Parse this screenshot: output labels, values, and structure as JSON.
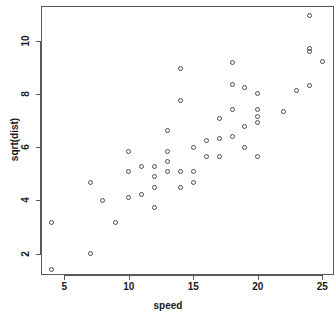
{
  "chart_data": {
    "type": "scatter",
    "title": "",
    "xlabel": "speed",
    "ylabel": "sqrt(dist)",
    "xlim": [
      3.2,
      25.9
    ],
    "ylim": [
      1.2,
      11.3
    ],
    "xticks": [
      5,
      10,
      15,
      20,
      25
    ],
    "yticks": [
      2,
      4,
      6,
      8,
      10
    ],
    "grid": false,
    "legend": null,
    "point_symbol": "open-circle",
    "point_color": "#4d4d4d",
    "n_points": 50,
    "x": [
      4,
      4,
      7,
      7,
      8,
      9,
      10,
      10,
      10,
      11,
      11,
      12,
      12,
      12,
      12,
      13,
      13,
      13,
      13,
      14,
      14,
      14,
      14,
      15,
      15,
      15,
      16,
      16,
      17,
      17,
      17,
      18,
      18,
      18,
      18,
      19,
      19,
      19,
      20,
      20,
      20,
      20,
      20,
      22,
      23,
      24,
      24,
      24,
      24,
      25
    ],
    "y": [
      1.41,
      3.16,
      2.0,
      4.69,
      4.0,
      3.16,
      4.12,
      5.1,
      5.83,
      4.24,
      5.29,
      3.74,
      4.47,
      4.9,
      5.29,
      5.1,
      5.48,
      5.83,
      6.63,
      4.47,
      5.1,
      7.75,
      8.94,
      4.69,
      5.1,
      6.0,
      5.66,
      6.24,
      5.66,
      6.32,
      7.07,
      6.4,
      7.42,
      8.37,
      9.17,
      6.0,
      6.78,
      8.25,
      5.66,
      6.93,
      7.14,
      7.42,
      8.0,
      7.35,
      8.12,
      8.31,
      9.59,
      9.7,
      10.95,
      9.22
    ],
    "points": [
      {
        "x": 4,
        "y": 1.41
      },
      {
        "x": 4,
        "y": 3.16
      },
      {
        "x": 7,
        "y": 2.0
      },
      {
        "x": 7,
        "y": 4.69
      },
      {
        "x": 8,
        "y": 4.0
      },
      {
        "x": 9,
        "y": 3.16
      },
      {
        "x": 10,
        "y": 4.12
      },
      {
        "x": 10,
        "y": 5.1
      },
      {
        "x": 10,
        "y": 5.83
      },
      {
        "x": 11,
        "y": 4.24
      },
      {
        "x": 11,
        "y": 5.29
      },
      {
        "x": 12,
        "y": 3.74
      },
      {
        "x": 12,
        "y": 4.47
      },
      {
        "x": 12,
        "y": 4.9
      },
      {
        "x": 12,
        "y": 5.29
      },
      {
        "x": 13,
        "y": 5.1
      },
      {
        "x": 13,
        "y": 5.48
      },
      {
        "x": 13,
        "y": 5.83
      },
      {
        "x": 13,
        "y": 6.63
      },
      {
        "x": 14,
        "y": 4.47
      },
      {
        "x": 14,
        "y": 5.1
      },
      {
        "x": 14,
        "y": 7.75
      },
      {
        "x": 14,
        "y": 8.94
      },
      {
        "x": 15,
        "y": 4.69
      },
      {
        "x": 15,
        "y": 5.1
      },
      {
        "x": 15,
        "y": 6.0
      },
      {
        "x": 16,
        "y": 5.66
      },
      {
        "x": 16,
        "y": 6.24
      },
      {
        "x": 17,
        "y": 5.66
      },
      {
        "x": 17,
        "y": 6.32
      },
      {
        "x": 17,
        "y": 7.07
      },
      {
        "x": 18,
        "y": 6.4
      },
      {
        "x": 18,
        "y": 7.42
      },
      {
        "x": 18,
        "y": 8.37
      },
      {
        "x": 18,
        "y": 9.17
      },
      {
        "x": 19,
        "y": 6.0
      },
      {
        "x": 19,
        "y": 6.78
      },
      {
        "x": 19,
        "y": 8.25
      },
      {
        "x": 20,
        "y": 5.66
      },
      {
        "x": 20,
        "y": 6.93
      },
      {
        "x": 20,
        "y": 7.14
      },
      {
        "x": 20,
        "y": 7.42
      },
      {
        "x": 20,
        "y": 8.0
      },
      {
        "x": 22,
        "y": 7.35
      },
      {
        "x": 23,
        "y": 8.12
      },
      {
        "x": 24,
        "y": 8.31
      },
      {
        "x": 24,
        "y": 9.59
      },
      {
        "x": 24,
        "y": 9.7
      },
      {
        "x": 24,
        "y": 10.95
      },
      {
        "x": 25,
        "y": 9.22
      }
    ]
  }
}
